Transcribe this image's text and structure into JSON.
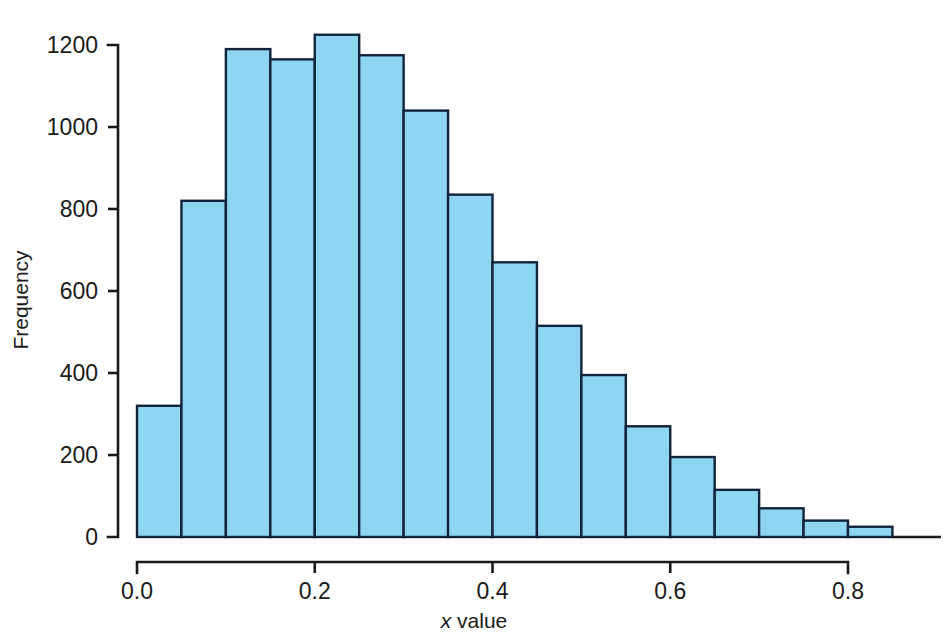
{
  "chart_data": {
    "type": "bar",
    "title": "",
    "subtitle": "",
    "xlabel": "x value",
    "xlabel_italic_part": "x",
    "xlabel_rest": " value",
    "ylabel": "Frequency",
    "grid": false,
    "legend": "none",
    "bin_width": 0.05,
    "xlim": [
      0.0,
      0.88
    ],
    "ylim": [
      0,
      1260
    ],
    "xticks": [
      0.0,
      0.2,
      0.4,
      0.6,
      0.8
    ],
    "xtick_labels": [
      "0.0",
      "0.2",
      "0.4",
      "0.6",
      "0.8"
    ],
    "yticks": [
      0,
      200,
      400,
      600,
      800,
      1000,
      1200
    ],
    "ytick_labels": [
      "0",
      "200",
      "400",
      "600",
      "800",
      "1000",
      "1200"
    ],
    "bin_edges": [
      0.0,
      0.05,
      0.1,
      0.15,
      0.2,
      0.25,
      0.3,
      0.35,
      0.4,
      0.45,
      0.5,
      0.55,
      0.6,
      0.65,
      0.7,
      0.75,
      0.8,
      0.85
    ],
    "categories": [
      "0.00-0.05",
      "0.05-0.10",
      "0.10-0.15",
      "0.15-0.20",
      "0.20-0.25",
      "0.25-0.30",
      "0.30-0.35",
      "0.35-0.40",
      "0.40-0.45",
      "0.45-0.50",
      "0.50-0.55",
      "0.55-0.60",
      "0.60-0.65",
      "0.65-0.70",
      "0.70-0.75",
      "0.75-0.80",
      "0.80-0.85"
    ],
    "values": [
      320,
      820,
      1190,
      1165,
      1225,
      1175,
      1040,
      835,
      670,
      515,
      395,
      270,
      195,
      115,
      70,
      40,
      25
    ],
    "series": [
      {
        "name": "Frequency",
        "values": [
          320,
          820,
          1190,
          1165,
          1225,
          1175,
          1040,
          835,
          670,
          515,
          395,
          270,
          195,
          115,
          70,
          40,
          25
        ]
      }
    ],
    "colors": {
      "bar_fill": "#8ed5f2",
      "bar_stroke": "#12243b",
      "axis": "#1a1a1a",
      "background": "#ffffff",
      "text": "#1a1a1a"
    }
  }
}
